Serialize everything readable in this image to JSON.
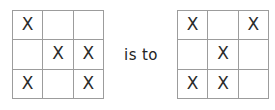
{
  "figure": {
    "type": "visual-analogy",
    "relation_label": "is to",
    "mark_glyph": "X",
    "empty_glyph": "",
    "grid_line_color": "#9c9c9c",
    "mark_color": "#2b2b2b",
    "background_color": "#ffffff"
  },
  "grids": [
    {
      "name": "left-grid",
      "rows": 3,
      "columns": 3,
      "cells": [
        [
          "X",
          "",
          ""
        ],
        [
          "",
          "X",
          "X"
        ],
        [
          "X",
          "",
          "X"
        ]
      ],
      "mark_count": 5
    },
    {
      "name": "right-grid",
      "rows": 3,
      "columns": 3,
      "cells": [
        [
          "X",
          "",
          "X"
        ],
        [
          "",
          "X",
          ""
        ],
        [
          "X",
          "X",
          ""
        ]
      ],
      "mark_count": 5
    }
  ]
}
